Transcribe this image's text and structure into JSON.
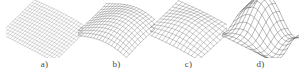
{
  "figure": {
    "background_color": "#ffffff",
    "caption_color": "#4a4a4a",
    "subfigures": [
      {
        "id": "a",
        "label": "a)",
        "left": 6,
        "stroke_color": "#8a8a8a",
        "stroke_width": 0.35,
        "grid_u": 22,
        "grid_v": 14,
        "surface_kind": "near-flat-slope",
        "amplitude": 0.1,
        "wave_count": 1.0,
        "tilt": 0.18
      },
      {
        "id": "b",
        "label": "b)",
        "left": 78,
        "stroke_color": "#707070",
        "stroke_width": 0.4,
        "grid_u": 18,
        "grid_v": 12,
        "surface_kind": "s-ridge",
        "amplitude": 0.42,
        "wave_count": 1.0,
        "tilt": 0.12
      },
      {
        "id": "c",
        "label": "c)",
        "left": 150,
        "stroke_color": "#6e6e6e",
        "stroke_width": 0.4,
        "grid_u": 15,
        "grid_v": 11,
        "surface_kind": "smooth-dome",
        "amplitude": 0.26,
        "wave_count": 0.6,
        "tilt": 0.1
      },
      {
        "id": "d",
        "label": "d)",
        "left": 222,
        "stroke_color": "#5e5e5e",
        "stroke_width": 0.45,
        "grid_u": 13,
        "grid_v": 10,
        "surface_kind": "double-fold",
        "amplitude": 0.55,
        "wave_count": 2.0,
        "tilt": 0.08
      }
    ]
  },
  "chart_data": {
    "type": "line",
    "title": "",
    "xlabel": "",
    "ylabel": "",
    "panels": [
      {
        "name": "a)",
        "type": "surface-wireframe",
        "description": "3D mesh surface, nearly planar with a gentle downward slope toward the front-left corner",
        "grid": [
          22,
          14
        ],
        "z_amplitude": 0.1,
        "z_range": [
          -0.1,
          0.1
        ]
      },
      {
        "name": "b)",
        "type": "surface-wireframe",
        "description": "3D mesh surface with a single pronounced S-shaped ridge crossing the middle",
        "grid": [
          18,
          12
        ],
        "z_amplitude": 0.42,
        "z_range": [
          -0.42,
          0.42
        ]
      },
      {
        "name": "c)",
        "type": "surface-wireframe",
        "description": "3D mesh surface, smooth broad dome with mild curvature",
        "grid": [
          15,
          11
        ],
        "z_amplitude": 0.26,
        "z_range": [
          -0.26,
          0.26
        ]
      },
      {
        "name": "d)",
        "type": "surface-wireframe",
        "description": "3D mesh surface with two wavy folds, coarsest mesh and largest deformation",
        "grid": [
          13,
          10
        ],
        "z_amplitude": 0.55,
        "z_range": [
          -0.55,
          0.55
        ]
      }
    ]
  }
}
